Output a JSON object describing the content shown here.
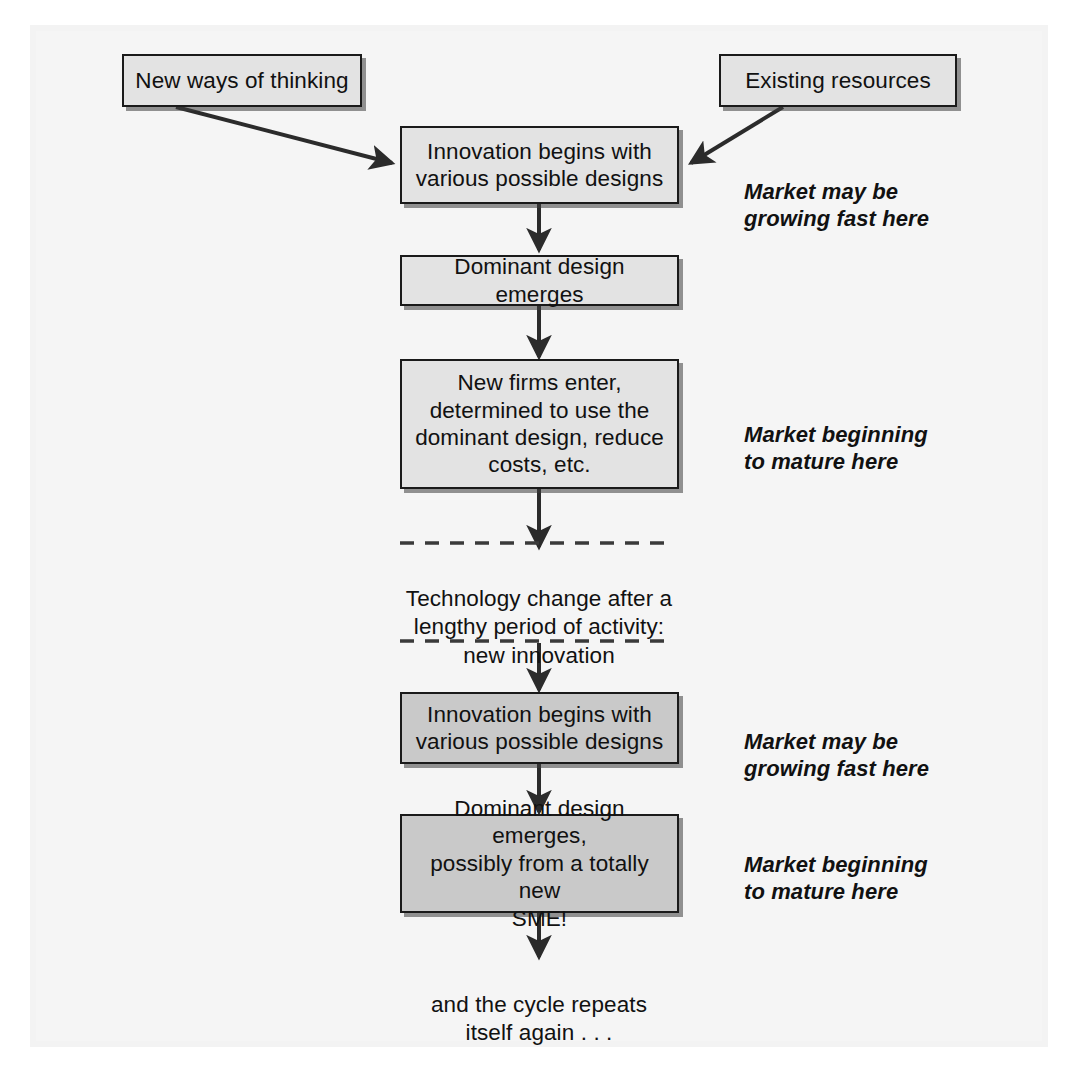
{
  "diagram": {
    "nodes": [
      {
        "id": "new-ways-of-thinking",
        "label": "New ways of thinking",
        "fill": "#e3e3e3"
      },
      {
        "id": "existing-resources",
        "label": "Existing resources",
        "fill": "#e3e3e3"
      },
      {
        "id": "innovation-begins-1",
        "label": "Innovation begins with\nvarious possible designs",
        "fill": "#e3e3e3"
      },
      {
        "id": "dominant-design-emerges",
        "label": "Dominant design emerges",
        "fill": "#e3e3e3"
      },
      {
        "id": "new-firms-enter",
        "label": "New firms enter,\ndetermined to use the\ndominant design, reduce\ncosts, etc.",
        "fill": "#e3e3e3"
      },
      {
        "id": "innovation-begins-2",
        "label": "Innovation begins with\nvarious possible designs",
        "fill": "#c9c9c9"
      },
      {
        "id": "dominant-design-sme",
        "label": "Dominant design emerges,\npossibly from a totally new\nSME!",
        "fill": "#c9c9c9"
      }
    ],
    "notes": [
      {
        "id": "note-market-growing-1",
        "text": "Market may be\ngrowing fast here"
      },
      {
        "id": "note-market-mature-1",
        "text": "Market  beginning\nto mature here"
      },
      {
        "id": "note-market-growing-2",
        "text": "Market may be\ngrowing fast here"
      },
      {
        "id": "note-market-mature-2",
        "text": "Market beginning\nto mature here"
      }
    ],
    "interstitial": {
      "id": "technology-change-note",
      "text": "Technology change after a\nlengthy period of activity:\nnew innovation"
    },
    "closing": {
      "id": "cycle-repeats-note",
      "text": "and the cycle repeats\nitself again . . ."
    },
    "colors": {
      "box_border": "#1a1a1a",
      "box_fill_light": "#e3e3e3",
      "box_fill_dark": "#c9c9c9",
      "connector": "#2b2b2b",
      "text": "#111111",
      "page_background": "#f5f5f5"
    }
  }
}
